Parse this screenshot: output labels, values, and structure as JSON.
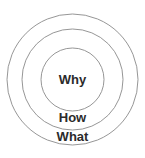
{
  "diagram": {
    "background_color": "#ffffff",
    "canvas": {
      "width": 145,
      "height": 158
    },
    "center": {
      "x": 72.5,
      "y": 79.5
    },
    "stroke_color": "#8a8a8a",
    "stroke_width": 0.9,
    "rings": [
      {
        "id": "outer",
        "label": "What",
        "radius": 65.5,
        "fill_color": "#ffffff",
        "stroke_color": "#8a8a8a",
        "label_color": "#2b2b2b",
        "label_font_size": 13,
        "label_x": 72.5,
        "label_y": 137.5
      },
      {
        "id": "middle",
        "label": "How",
        "radius": 50.5,
        "fill_color": "#ffffff",
        "stroke_color": "#8a8a8a",
        "label_color": "#2b2b2b",
        "label_font_size": 13,
        "label_x": 72.5,
        "label_y": 119.0
      },
      {
        "id": "inner",
        "label": "Why",
        "radius": 31.5,
        "fill_color": "#e4e4e4",
        "stroke_color": "#8a8a8a",
        "label_color": "#2b2b2b",
        "label_font_size": 13,
        "label_x": 72.5,
        "label_y": 80.5
      }
    ]
  }
}
